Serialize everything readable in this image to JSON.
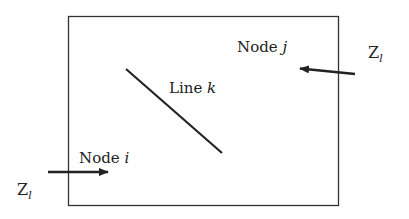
{
  "diagram": {
    "type": "network-boundary",
    "colors": {
      "stroke": "#222222",
      "background": "#ffffff"
    },
    "boundary": {
      "label": ""
    },
    "line": {
      "label_prefix": "Line ",
      "label_var": "k"
    },
    "node_i": {
      "label_prefix": "Node ",
      "label_var": "i"
    },
    "node_j": {
      "label_prefix": "Node ",
      "label_var": "j"
    },
    "impedance_left": {
      "symbol": "Z",
      "subscript": "l"
    },
    "impedance_right": {
      "symbol": "Z",
      "subscript": "l"
    }
  }
}
